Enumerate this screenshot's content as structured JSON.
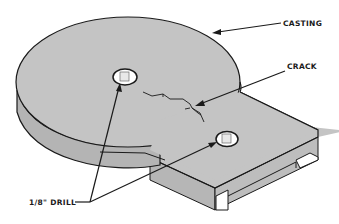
{
  "diagram": {
    "labels": {
      "casting": "CASTING",
      "crack": "CRACK",
      "drill": "1/8\" DRILL"
    },
    "colors": {
      "part_fill": "#c4c4c4",
      "side_fill": "#b4b4b4",
      "outline": "#1a1a1a",
      "background": "#ffffff"
    }
  }
}
